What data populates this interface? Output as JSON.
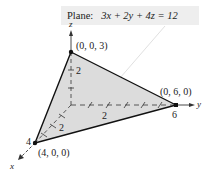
{
  "equation_label": {
    "prefix": "Plane:",
    "equation": "3x + 2y + 4z = 12"
  },
  "axes": {
    "x_label": "x",
    "y_label": "y",
    "z_label": "z"
  },
  "ticks": {
    "z_2": "2",
    "y_2": "2",
    "y_6": "6",
    "x_2": "2",
    "x_4": "4"
  },
  "vertices": {
    "z_intercept": "(0, 0, 3)",
    "y_intercept": "(0, 6, 0)",
    "x_intercept": "(4, 0, 0)"
  },
  "colors": {
    "plane_fill": "#dcdcdc",
    "edge": "#111111",
    "label_bg": "#eeeeee"
  }
}
